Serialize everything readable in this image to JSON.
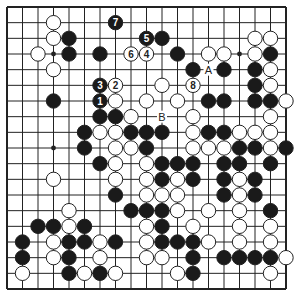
{
  "diagram": {
    "type": "go-board",
    "size": 19,
    "colors": {
      "black": "#1a1a1a",
      "white": "#ffffff",
      "line": "#222222",
      "background": "#ffffff"
    },
    "star_points_visible": [
      [
        3,
        3
      ],
      [
        15,
        3
      ],
      [
        3,
        9
      ]
    ],
    "labels": [
      {
        "text": "A",
        "col": 13,
        "row": 4
      },
      {
        "text": "B",
        "col": 10,
        "row": 7
      }
    ],
    "numbered_moves": [
      {
        "n": "1",
        "color": "black",
        "col": 6,
        "row": 6
      },
      {
        "n": "2",
        "color": "white",
        "col": 7,
        "row": 5
      },
      {
        "n": "3",
        "color": "black",
        "col": 6,
        "row": 5
      },
      {
        "n": "4",
        "color": "white",
        "col": 9,
        "row": 3
      },
      {
        "n": "5",
        "color": "black",
        "col": 9,
        "row": 2
      },
      {
        "n": "6",
        "color": "white",
        "col": 8,
        "row": 3
      },
      {
        "n": "7",
        "color": "black",
        "col": 7,
        "row": 1
      },
      {
        "n": "8",
        "color": "white",
        "col": 12,
        "row": 5
      }
    ],
    "black_stones": [
      [
        4,
        2
      ],
      [
        10,
        2
      ],
      [
        4,
        3
      ],
      [
        6,
        3
      ],
      [
        11,
        3
      ],
      [
        17,
        3
      ],
      [
        12,
        4
      ],
      [
        14,
        4
      ],
      [
        16,
        4
      ],
      [
        16,
        5
      ],
      [
        3,
        6
      ],
      [
        13,
        6
      ],
      [
        14,
        6
      ],
      [
        16,
        6
      ],
      [
        17,
        6
      ],
      [
        6,
        7
      ],
      [
        7,
        7
      ],
      [
        5,
        8
      ],
      [
        8,
        8
      ],
      [
        9,
        8
      ],
      [
        10,
        8
      ],
      [
        13,
        8
      ],
      [
        14,
        8
      ],
      [
        5,
        9
      ],
      [
        9,
        9
      ],
      [
        15,
        9
      ],
      [
        16,
        9
      ],
      [
        18,
        9
      ],
      [
        6,
        10
      ],
      [
        10,
        10
      ],
      [
        11,
        10
      ],
      [
        12,
        10
      ],
      [
        14,
        10
      ],
      [
        15,
        10
      ],
      [
        17,
        10
      ],
      [
        10,
        11
      ],
      [
        12,
        11
      ],
      [
        14,
        11
      ],
      [
        16,
        11
      ],
      [
        7,
        12
      ],
      [
        14,
        12
      ],
      [
        16,
        12
      ],
      [
        8,
        13
      ],
      [
        9,
        13
      ],
      [
        10,
        13
      ],
      [
        17,
        13
      ],
      [
        2,
        14
      ],
      [
        3,
        14
      ],
      [
        5,
        14
      ],
      [
        10,
        14
      ],
      [
        1,
        15
      ],
      [
        4,
        15
      ],
      [
        5,
        15
      ],
      [
        7,
        15
      ],
      [
        10,
        15
      ],
      [
        11,
        15
      ],
      [
        12,
        15
      ],
      [
        1,
        16
      ],
      [
        4,
        16
      ],
      [
        12,
        16
      ],
      [
        14,
        16
      ],
      [
        15,
        16
      ],
      [
        16,
        16
      ],
      [
        17,
        16
      ],
      [
        4,
        17
      ],
      [
        6,
        17
      ],
      [
        12,
        17
      ]
    ],
    "white_stones": [
      [
        3,
        1
      ],
      [
        3,
        2
      ],
      [
        16,
        2
      ],
      [
        17,
        2
      ],
      [
        2,
        3
      ],
      [
        13,
        3
      ],
      [
        14,
        3
      ],
      [
        16,
        3
      ],
      [
        3,
        4
      ],
      [
        17,
        4
      ],
      [
        10,
        5
      ],
      [
        17,
        5
      ],
      [
        7,
        6
      ],
      [
        9,
        6
      ],
      [
        11,
        6
      ],
      [
        18,
        6
      ],
      [
        8,
        7
      ],
      [
        12,
        7
      ],
      [
        17,
        7
      ],
      [
        6,
        8
      ],
      [
        7,
        8
      ],
      [
        12,
        8
      ],
      [
        15,
        8
      ],
      [
        16,
        8
      ],
      [
        17,
        8
      ],
      [
        7,
        9
      ],
      [
        8,
        9
      ],
      [
        12,
        9
      ],
      [
        13,
        9
      ],
      [
        14,
        9
      ],
      [
        17,
        9
      ],
      [
        7,
        10
      ],
      [
        9,
        10
      ],
      [
        3,
        11
      ],
      [
        7,
        11
      ],
      [
        9,
        11
      ],
      [
        11,
        11
      ],
      [
        15,
        11
      ],
      [
        9,
        12
      ],
      [
        10,
        12
      ],
      [
        11,
        12
      ],
      [
        15,
        12
      ],
      [
        4,
        13
      ],
      [
        11,
        13
      ],
      [
        13,
        13
      ],
      [
        15,
        13
      ],
      [
        4,
        14
      ],
      [
        9,
        14
      ],
      [
        12,
        14
      ],
      [
        15,
        14
      ],
      [
        17,
        14
      ],
      [
        3,
        15
      ],
      [
        6,
        15
      ],
      [
        9,
        15
      ],
      [
        13,
        15
      ],
      [
        15,
        15
      ],
      [
        17,
        15
      ],
      [
        3,
        16
      ],
      [
        6,
        16
      ],
      [
        9,
        16
      ],
      [
        10,
        16
      ],
      [
        18,
        16
      ],
      [
        1,
        17
      ],
      [
        5,
        17
      ],
      [
        7,
        17
      ],
      [
        11,
        17
      ],
      [
        17,
        17
      ]
    ]
  }
}
